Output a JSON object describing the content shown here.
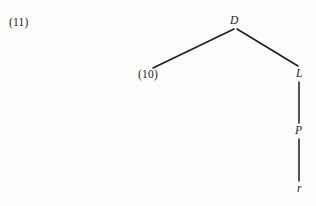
{
  "figure": {
    "example_number": "(11)",
    "background_color": "#fbfbfa",
    "line_color": "#1d1d1f"
  },
  "tree": {
    "nodes": [
      {
        "id": "root",
        "label": "D",
        "style": "italic",
        "x": 235,
        "y": 21
      },
      {
        "id": "left",
        "label": "(10)",
        "style": "upright",
        "x": 150,
        "y": 75
      },
      {
        "id": "right",
        "label": "L",
        "style": "italic",
        "x": 299,
        "y": 74
      },
      {
        "id": "mid",
        "label": "P",
        "style": "italic",
        "x": 299,
        "y": 131
      },
      {
        "id": "leaf",
        "label": "r",
        "style": "italic",
        "x": 299,
        "y": 188
      }
    ],
    "edges": [
      {
        "from": "root",
        "to": "left",
        "x1": 234,
        "y1": 29,
        "x2": 153,
        "y2": 68
      },
      {
        "from": "root",
        "to": "right",
        "x1": 237,
        "y1": 29,
        "x2": 298,
        "y2": 66
      },
      {
        "from": "right",
        "to": "mid",
        "x1": 299,
        "y1": 82,
        "x2": 299,
        "y2": 123
      },
      {
        "from": "mid",
        "to": "leaf",
        "x1": 299,
        "y1": 139,
        "x2": 299,
        "y2": 181
      }
    ]
  }
}
